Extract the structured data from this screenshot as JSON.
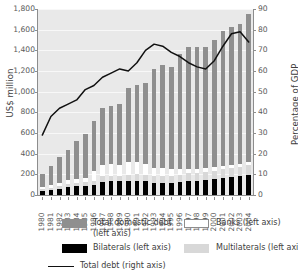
{
  "chart_data": {
    "type": "bar",
    "title": "",
    "subtitle": "",
    "xlabel": "",
    "ylabel": "US$ million",
    "ylabel_right": "Percentage of GDP",
    "ylim": [
      0,
      1800
    ],
    "ylim_right": [
      0,
      90
    ],
    "ytick_labels": [
      "0",
      "200",
      "400",
      "600",
      "800",
      "1,000",
      "1,200",
      "1,400",
      "1,600",
      "1,800"
    ],
    "ytick_values": [
      0,
      200,
      400,
      600,
      800,
      1000,
      1200,
      1400,
      1600,
      1800
    ],
    "ytick_labels_right": [
      "0",
      "10",
      "20",
      "30",
      "40",
      "50",
      "60",
      "70",
      "80",
      "90"
    ],
    "ytick_values_right": [
      0,
      10,
      20,
      30,
      40,
      50,
      60,
      70,
      80,
      90
    ],
    "grid": true,
    "legend_position": "bottom",
    "categories": [
      "1980",
      "1981",
      "1982",
      "1983",
      "1984",
      "1985",
      "1986",
      "1987",
      "1988",
      "1989",
      "1990",
      "1991",
      "1992",
      "1993",
      "1994",
      "1995",
      "1996",
      "1997",
      "1998",
      "1999",
      "2000",
      "2001",
      "2002",
      "2003",
      "2004"
    ],
    "stacked": true,
    "series": [
      {
        "name": "Bilaterals (left axis)",
        "axis": "left",
        "color": "#000000",
        "values": [
          40,
          52,
          66,
          88,
          96,
          100,
          120,
          150,
          160,
          168,
          172,
          176,
          172,
          160,
          152,
          148,
          176,
          184,
          192,
          196,
          206,
          216,
          228,
          236,
          240
        ]
      },
      {
        "name": "Multilaterals (left axis)",
        "axis": "left",
        "color": "#d8d8d8",
        "values": [
          20,
          24,
          30,
          34,
          38,
          44,
          50,
          60,
          66,
          70,
          76,
          80,
          84,
          88,
          90,
          92,
          96,
          100,
          104,
          108,
          112,
          116,
          120,
          124,
          128
        ]
      },
      {
        "name": "Banks (left axis)",
        "axis": "left",
        "color": "#ffffff",
        "values": [
          22,
          28,
          34,
          40,
          46,
          56,
          112,
          124,
          132,
          140,
          150,
          150,
          132,
          108,
          96,
          84,
          72,
          64,
          56,
          48,
          42,
          38,
          34,
          32,
          30
        ]
      },
      {
        "name": "Total domestic debt (left axis)",
        "axis": "left",
        "color": "#8f8f8f",
        "values": [
          128,
          196,
          270,
          338,
          420,
          500,
          598,
          646,
          678,
          750,
          902,
          942,
          1022,
          1282,
          1292,
          1276,
          1540,
          1596,
          1618,
          1606,
          1662,
          1706,
          1752,
          1780,
          1802
        ]
      }
    ],
    "bar_totals": [
      210,
      300,
      400,
      500,
      600,
      700,
      880,
      980,
      1036,
      1128,
      1300,
      1348,
      1410,
      1638,
      1630,
      1600,
      1884,
      1944,
      1970,
      1958,
      2022,
      2076,
      2134,
      2172,
      2200
    ],
    "bar_tops_left_axis": [
      200,
      285,
      370,
      440,
      520,
      590,
      720,
      840,
      860,
      880,
      1040,
      1060,
      1085,
      1220,
      1260,
      1240,
      1365,
      1430,
      1430,
      1430,
      1500,
      1590,
      1630,
      1655,
      1750
    ],
    "line_series": {
      "name": "Total debt (right axis)",
      "axis": "right",
      "color": "#111111",
      "values": [
        29,
        38,
        42,
        44,
        46,
        51,
        53,
        57,
        59,
        61,
        60,
        64,
        66,
        70,
        73,
        72,
        69,
        69,
        67,
        64,
        62,
        61,
        61,
        65,
        70,
        75,
        78,
        79,
        78,
        76,
        74
      ]
    },
    "line_values_by_year": [
      29,
      38,
      42,
      44,
      46,
      51,
      53,
      57,
      59,
      61,
      60,
      64,
      70,
      73,
      72,
      69,
      67,
      64,
      62,
      61,
      65,
      72,
      78,
      79,
      74
    ]
  },
  "legend": {
    "items": [
      {
        "label": "Total domestic debt\n(left axis)",
        "label_line1": "Total domestic debt",
        "label_line2": "(left axis)",
        "swatch": "dom"
      },
      {
        "label": "Banks (left axis)",
        "swatch": "banks"
      },
      {
        "label": "Bilaterals (left axis)",
        "swatch": "bil"
      },
      {
        "label": "Multilaterals (left axis)",
        "swatch": "multi"
      },
      {
        "label": "Total debt (right axis)",
        "swatch": "line"
      }
    ]
  }
}
